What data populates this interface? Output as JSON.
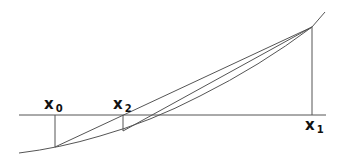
{
  "diagram": {
    "title": "",
    "labels": {
      "x0": {
        "base": "x",
        "sub": "0"
      },
      "x2": {
        "base": "x",
        "sub": "2"
      },
      "x1": {
        "base": "x",
        "sub": "1"
      }
    },
    "colors": {
      "line": "#555555",
      "text": "#111111",
      "background": "#ffffff"
    }
  }
}
